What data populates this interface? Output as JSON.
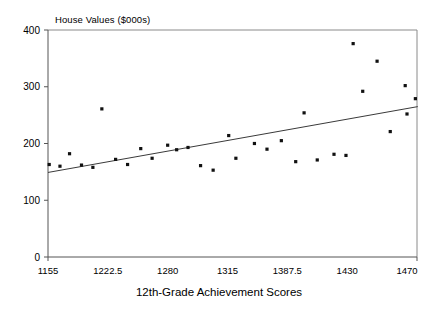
{
  "chart_data": {
    "type": "scatter",
    "title": "House Values ($000s)",
    "xlabel": "12th-Grade Achievement Scores",
    "ylabel": "",
    "ylim": [
      0,
      400
    ],
    "ytick_labels": [
      "0",
      "100",
      "200",
      "300",
      "400"
    ],
    "ytick_values": [
      0,
      100,
      200,
      300,
      400
    ],
    "xtick_labels": [
      "1155",
      "1222.5",
      "1280",
      "1315",
      "1387.5",
      "1430",
      "1470"
    ],
    "xtick_positions": [
      0,
      1,
      2,
      3,
      4,
      5,
      6
    ],
    "grid": false,
    "legend": null,
    "x_is_categorical_spacing": true,
    "points": [
      {
        "xpos": 0.02,
        "y": 163
      },
      {
        "xpos": 0.2,
        "y": 160
      },
      {
        "xpos": 0.36,
        "y": 182
      },
      {
        "xpos": 0.56,
        "y": 162
      },
      {
        "xpos": 0.75,
        "y": 158
      },
      {
        "xpos": 0.9,
        "y": 261
      },
      {
        "xpos": 1.13,
        "y": 172
      },
      {
        "xpos": 1.33,
        "y": 163
      },
      {
        "xpos": 1.55,
        "y": 191
      },
      {
        "xpos": 1.74,
        "y": 174
      },
      {
        "xpos": 2.0,
        "y": 197
      },
      {
        "xpos": 2.15,
        "y": 189
      },
      {
        "xpos": 2.34,
        "y": 193
      },
      {
        "xpos": 2.55,
        "y": 161
      },
      {
        "xpos": 2.76,
        "y": 153
      },
      {
        "xpos": 3.02,
        "y": 214
      },
      {
        "xpos": 3.14,
        "y": 174
      },
      {
        "xpos": 3.45,
        "y": 200
      },
      {
        "xpos": 3.66,
        "y": 190
      },
      {
        "xpos": 3.9,
        "y": 205
      },
      {
        "xpos": 4.14,
        "y": 168
      },
      {
        "xpos": 4.28,
        "y": 254
      },
      {
        "xpos": 4.5,
        "y": 171
      },
      {
        "xpos": 4.78,
        "y": 181
      },
      {
        "xpos": 4.98,
        "y": 179
      },
      {
        "xpos": 5.1,
        "y": 376
      },
      {
        "xpos": 5.26,
        "y": 292
      },
      {
        "xpos": 5.5,
        "y": 345
      },
      {
        "xpos": 5.72,
        "y": 221
      },
      {
        "xpos": 5.97,
        "y": 302
      },
      {
        "xpos": 6.0,
        "y": 252
      },
      {
        "xpos": 6.14,
        "y": 279
      }
    ],
    "trend_line": {
      "x_start": 0.0,
      "y_start": 149,
      "x_end": 6.18,
      "y_end": 265
    }
  }
}
